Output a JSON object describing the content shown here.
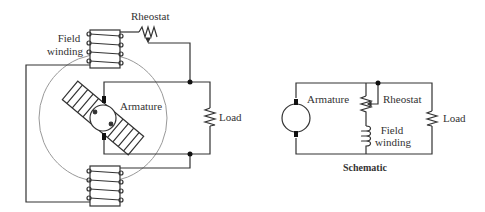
{
  "physical": {
    "labels": {
      "rheostat": "Rheostat",
      "field_winding_line1": "Field",
      "field_winding_line2": "winding",
      "armature": "Armature",
      "load": "Load"
    }
  },
  "schematic": {
    "title": "Schematic",
    "labels": {
      "armature": "Armature",
      "rheostat": "Rheostat",
      "field_winding_line1": "Field",
      "field_winding_line2": "winding",
      "load": "Load"
    }
  },
  "colors": {
    "wire": "#333333",
    "frame_circle": "#999999",
    "text": "#333333"
  }
}
